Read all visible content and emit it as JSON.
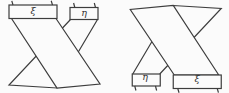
{
  "figure": {
    "left": {
      "wide_band_label": "ξ",
      "narrow_band_label": "η"
    },
    "right": {
      "narrow_band_label": "η",
      "wide_band_label": "ξ"
    },
    "colors": {
      "background": "#fbfbfb",
      "line": "#3d3d3d"
    }
  }
}
